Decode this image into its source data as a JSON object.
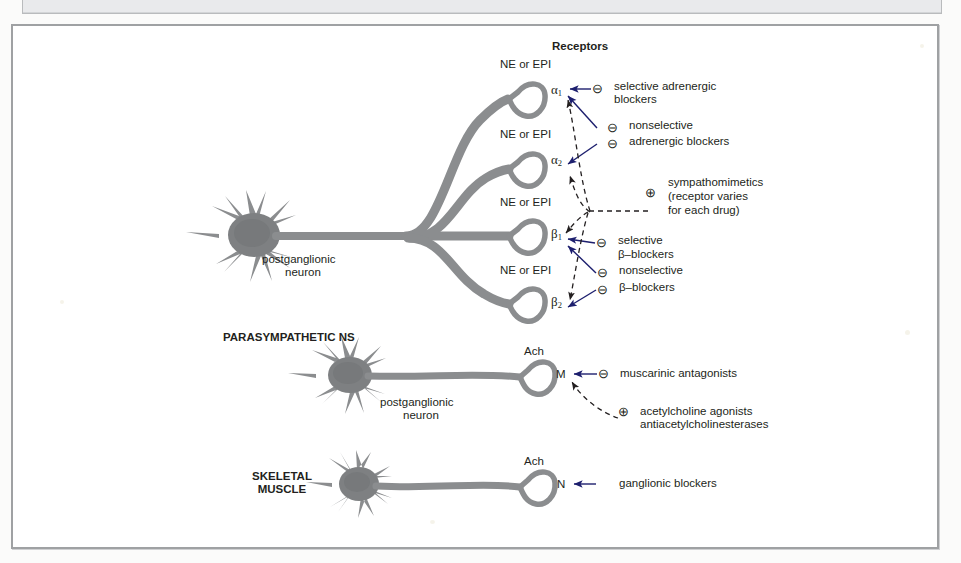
{
  "figure": {
    "title": "Receptors",
    "neurotransmitter_label": "NE or EPI",
    "ach_label": "Ach",
    "postganglionic_line1": "postganglionic",
    "postganglionic_line2": "neuron",
    "parasympathetic_label": "PARASYMPATHETIC NS",
    "skeletal_line1": "SKELETAL",
    "skeletal_line2": "MUSCLE",
    "colors": {
      "neuron": "#8b8d8f",
      "neuron_fill": "#7e8082",
      "text": "#231f20",
      "arrow": "#1d1f6e",
      "frame": "#9fa1a3",
      "page": "#ffffff"
    }
  },
  "receptors": [
    {
      "id": "alpha1",
      "symbol": "α",
      "subscript": "1",
      "transmitter": "NE or EPI"
    },
    {
      "id": "alpha2",
      "symbol": "α",
      "subscript": "2",
      "transmitter": "NE or EPI"
    },
    {
      "id": "beta1",
      "symbol": "β",
      "subscript": "1",
      "transmitter": "NE or EPI"
    },
    {
      "id": "beta2",
      "symbol": "β",
      "subscript": "2",
      "transmitter": "NE or EPI"
    },
    {
      "id": "muscarinic",
      "symbol": "M",
      "subscript": "",
      "transmitter": "Ach"
    },
    {
      "id": "nicotinic",
      "symbol": "N",
      "subscript": "",
      "transmitter": "Ach"
    }
  ],
  "drug_annotations": [
    {
      "id": "selective-adrenergic-blockers",
      "sign": "⊖",
      "line1": "selective adrenergic",
      "line2": "blockers",
      "targets": [
        "alpha1"
      ]
    },
    {
      "id": "nonselective-adrenergic-blockers",
      "sign": "⊖",
      "line1": "nonselective",
      "line2": "adrenergic blockers",
      "targets": [
        "alpha1",
        "alpha2"
      ]
    },
    {
      "id": "sympathomimetics",
      "sign": "⊕",
      "line1": "sympathomimetics",
      "line2": "(receptor varies",
      "line3": "for each drug)",
      "targets": [
        "alpha1",
        "alpha2",
        "beta1",
        "beta2"
      ]
    },
    {
      "id": "selective-beta-blockers",
      "sign": "⊖",
      "line1": "selective",
      "line2": "β–blockers",
      "targets": [
        "beta1"
      ]
    },
    {
      "id": "nonselective-beta-blockers",
      "sign": "⊖",
      "line1": "nonselective",
      "line2": "β–blockers",
      "targets": [
        "beta1",
        "beta2"
      ]
    },
    {
      "id": "muscarinic-antagonists",
      "sign": "⊖",
      "line1": "muscarinic antagonists",
      "line2": "",
      "targets": [
        "muscarinic"
      ]
    },
    {
      "id": "acetylcholine-agonists",
      "sign": "⊕",
      "line1": "acetylcholine agonists",
      "line2": "antiacetylcholinesterases",
      "targets": [
        "muscarinic"
      ]
    },
    {
      "id": "ganglionic-blockers",
      "sign": "⊖",
      "line1": "ganglionic blockers",
      "line2": "",
      "targets": [
        "nicotinic"
      ]
    }
  ],
  "labels": {
    "title": "Receptors",
    "ne_epi_1": "NE or EPI",
    "ne_epi_2": "NE or EPI",
    "ne_epi_3": "NE or EPI",
    "ne_epi_4": "NE or EPI",
    "ach_1": "Ach",
    "ach_2": "Ach",
    "alpha1": "α",
    "alpha1_sub": "1",
    "alpha2": "α",
    "alpha2_sub": "2",
    "beta1": "β",
    "beta1_sub": "1",
    "beta2": "β",
    "beta2_sub": "2",
    "m": "M",
    "n": "N",
    "postganglionic_a1": "postganglionic",
    "postganglionic_a2": "neuron",
    "postganglionic_b1": "postganglionic",
    "postganglionic_b2": "neuron",
    "parasympathetic": "PARASYMPATHETIC NS",
    "skeletal1": "SKELETAL",
    "skeletal2": "MUSCLE",
    "sel_adr_1": "selective adrenergic",
    "sel_adr_2": "blockers",
    "nonsel_adr_1": "nonselective",
    "nonsel_adr_2": "adrenergic blockers",
    "symp_1": "sympathomimetics",
    "symp_2": "(receptor varies",
    "symp_3": "for each drug)",
    "sel_beta_1": "selective",
    "sel_beta_2": "β–blockers",
    "nonsel_beta_1": "nonselective",
    "nonsel_beta_2": "β–blockers",
    "musc_ant": "muscarinic antagonists",
    "ach_ag_1": "acetylcholine agonists",
    "ach_ag_2": "antiacetylcholinesterases",
    "gang_block": "ganglionic blockers",
    "sign_minus_1": "⊖",
    "sign_minus_2": "⊖",
    "sign_minus_3": "⊖",
    "sign_minus_4": "⊖",
    "sign_minus_5": "⊖",
    "sign_minus_6": "⊖",
    "sign_minus_7": "⊖",
    "sign_plus_1": "⊕",
    "sign_plus_2": "⊕"
  }
}
